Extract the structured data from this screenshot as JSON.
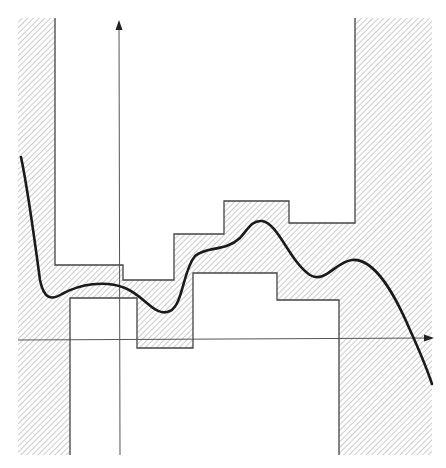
{
  "diagram": {
    "colors": {
      "background": "#ffffff",
      "hatch": "#9a9a9a",
      "outline": "#444444",
      "axis": "#555555",
      "curve": "#1a1a1a"
    },
    "axes": {
      "x_axis": {
        "y": 340,
        "x_start": 18,
        "x_end": 432,
        "arrow": "right"
      },
      "y_axis": {
        "x": 119,
        "y_start": 455,
        "y_end": 22,
        "arrow": "up"
      }
    },
    "upper_envelope": [
      [
        55,
        18
      ],
      [
        55,
        265
      ],
      [
        123,
        265
      ],
      [
        123,
        280
      ],
      [
        174,
        280
      ],
      [
        174,
        234
      ],
      [
        224,
        234
      ],
      [
        224,
        201
      ],
      [
        289,
        201
      ],
      [
        289,
        223
      ],
      [
        355,
        223
      ],
      [
        355,
        18
      ]
    ],
    "lower_envelope": [
      [
        70,
        455
      ],
      [
        70,
        298
      ],
      [
        137,
        298
      ],
      [
        137,
        348
      ],
      [
        193,
        348
      ],
      [
        193,
        273
      ],
      [
        277,
        273
      ],
      [
        277,
        300
      ],
      [
        339,
        300
      ],
      [
        339,
        455
      ]
    ],
    "curve_path": "M21,157 C28,190 36,250 40,280 C44,300 52,300 62,294 C80,284 105,280 125,288 C145,296 155,318 170,311 C183,305 183,270 195,256 C206,246 225,252 240,238 C248,229 252,220 262,221 C278,223 290,262 310,275 C325,284 335,262 352,260 C375,258 395,295 410,330 C420,352 428,372 432,384",
    "frame": {
      "left": 18,
      "right": 432,
      "top": 18,
      "bottom": 455
    }
  }
}
